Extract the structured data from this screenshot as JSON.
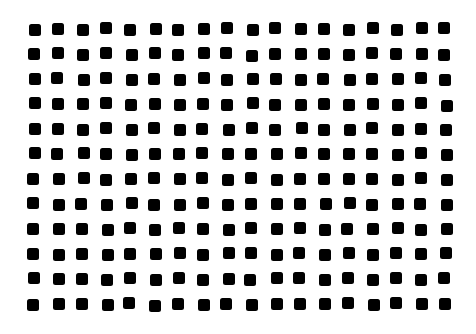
{
  "pattern": {
    "rows": 12,
    "cols": 18,
    "dot_color": "#000000",
    "background": "#ffffff",
    "dot_size": 12,
    "origin_x": 28,
    "origin_y": 23,
    "pitch_x": 24.2,
    "pitch_y": 25.0
  }
}
